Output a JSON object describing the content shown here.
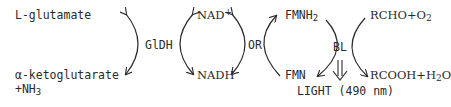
{
  "diagram": {
    "type": "coupled enzymatic reaction scheme",
    "left_pair": {
      "top": "L-glutamate",
      "bottom_line1": "α-ketoglutarate",
      "bottom_line2_prefix": "+NH",
      "bottom_line2_sub": "3"
    },
    "enzyme1": "GlDH",
    "nad_pair": {
      "top_base": "NAD",
      "top_sup": "+",
      "bottom": "NADH"
    },
    "enzyme2": "OR",
    "fmn_pair": {
      "top_base": "FMNH",
      "top_sub": "2",
      "bottom": "FMN"
    },
    "enzyme3": "BL",
    "light_output": "LIGHT (490 nm)",
    "right_pair": {
      "top_prefix": "RCHO+O",
      "top_sub": "2",
      "bottom_prefix": "RCOOH+H",
      "bottom_sub": "2",
      "bottom_suffix": "O"
    },
    "line_color": "#2a2a2a"
  }
}
